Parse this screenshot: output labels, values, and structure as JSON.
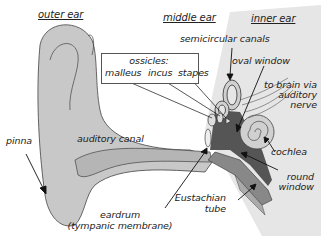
{
  "sections": {
    "outer": "outer ear",
    "middle": "middle ear",
    "inner": "inner ear"
  },
  "labels": {
    "semicircular_canals": "semicircular canals",
    "ossicles": "ossicles:",
    "malleus": "malleus",
    "incus": "incus",
    "stapes": "stapes",
    "oval_window": "oval window",
    "to_brain_1": "to brain via",
    "to_brain_2": "auditory",
    "to_brain_3": "nerve",
    "pinna": "pinna",
    "auditory_canal": "auditory canal",
    "cochlea": "cochlea",
    "round_window_1": "round",
    "round_window_2": "window",
    "eustachian_1": "Eustachian",
    "eustachian_2": "tube",
    "eardrum_1": "eardrum",
    "eardrum_2": "(tympanic membrane)"
  },
  "colors": {
    "ear_fill": "#c8c8c8",
    "inner_bg": "#e4e4e4",
    "dark_bone": "#555555",
    "outline": "#444444"
  }
}
